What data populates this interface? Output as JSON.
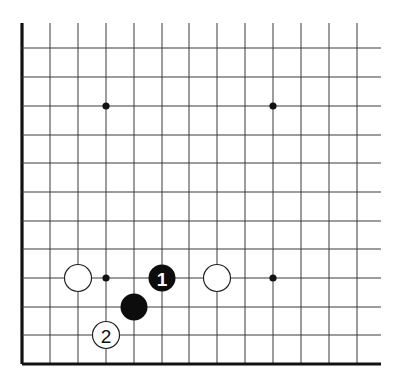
{
  "diagram": {
    "type": "go-board-fragment",
    "view": "lower-left corner",
    "columns": 13,
    "rows": 12,
    "x_lines": [
      22,
      50,
      78,
      106,
      134,
      162,
      189,
      217,
      245,
      273,
      301,
      329,
      357
    ],
    "y_lines": [
      48,
      77,
      106,
      135,
      163,
      192,
      221,
      249,
      278,
      307,
      335,
      364
    ],
    "top_y": 23,
    "right_x": 381,
    "edges": [
      "left",
      "bottom"
    ],
    "colors": {
      "black": "#0d0d0d",
      "white": "#ffffff",
      "line": "#3a3a3a"
    },
    "star_points": [
      {
        "col": 3,
        "row": 2
      },
      {
        "col": 9,
        "row": 2
      },
      {
        "col": 3,
        "row": 8
      },
      {
        "col": 9,
        "row": 8
      }
    ],
    "stones": [
      {
        "color": "white",
        "col": 2,
        "row": 8,
        "label": ""
      },
      {
        "color": "black",
        "col": 5,
        "row": 8,
        "label": "1"
      },
      {
        "color": "white",
        "col": 7,
        "row": 8,
        "label": ""
      },
      {
        "color": "black",
        "col": 4,
        "row": 9,
        "label": ""
      },
      {
        "color": "white",
        "col": 3,
        "row": 10,
        "label": "2"
      }
    ]
  }
}
